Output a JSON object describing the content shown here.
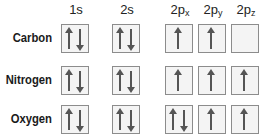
{
  "diagram": {
    "type": "orbital-box-diagram",
    "columns": [
      {
        "id": "1s",
        "base": "1s",
        "sub": ""
      },
      {
        "id": "2s",
        "base": "2s",
        "sub": ""
      },
      {
        "id": "2px",
        "base": "2p",
        "sub": "x"
      },
      {
        "id": "2py",
        "base": "2p",
        "sub": "y"
      },
      {
        "id": "2pz",
        "base": "2p",
        "sub": "z"
      }
    ],
    "rows": [
      {
        "label": "Carbon",
        "orbitals": [
          "updown",
          "updown",
          "up",
          "up",
          "empty"
        ]
      },
      {
        "label": "Nitrogen",
        "orbitals": [
          "updown",
          "updown",
          "up",
          "up",
          "up"
        ]
      },
      {
        "label": "Oxygen",
        "orbitals": [
          "updown",
          "updown",
          "updown",
          "up",
          "up"
        ]
      }
    ],
    "colors": {
      "box_border": "#8c8c8c",
      "box_fill": "#f4f4f4",
      "arrow": "#555555",
      "text": "#1a1a1a"
    }
  }
}
